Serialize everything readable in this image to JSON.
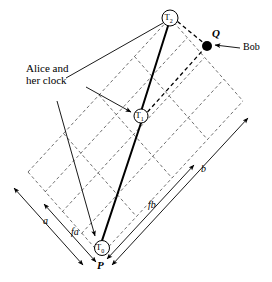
{
  "figure": {
    "type": "spacetime-diagram",
    "background_color": "#ffffff",
    "stroke_color": "#000000",
    "dash_color": "#555555",
    "nodes": [
      {
        "id": "T0",
        "label": "T",
        "sub": "0",
        "x": 102,
        "y": 248,
        "r": 7.5
      },
      {
        "id": "T1",
        "label": "T",
        "sub": "1",
        "x": 141,
        "y": 116,
        "r": 7.0
      },
      {
        "id": "T2",
        "label": "T",
        "sub": "2",
        "x": 170,
        "y": 18,
        "r": 8.0
      }
    ],
    "points": [
      {
        "id": "P",
        "label": "P",
        "x": 102,
        "y": 248,
        "label_x": 97,
        "label_y": 261
      },
      {
        "id": "Q",
        "label": "Q",
        "x": 207,
        "y": 46,
        "label_x": 212,
        "label_y": 29,
        "dot_r": 5
      }
    ],
    "annotations": [
      {
        "id": "alice",
        "line1": "Alice and",
        "line2": "her clock",
        "x": 26,
        "y": 63
      },
      {
        "id": "bob",
        "text": "Bob",
        "x": 243,
        "y": 43
      }
    ],
    "vectors": [
      {
        "id": "a",
        "label": "a",
        "label_x": 43,
        "label_y": 216
      },
      {
        "id": "fa",
        "label": "fa",
        "label_x": 71,
        "label_y": 227
      },
      {
        "id": "fb",
        "label": "fb",
        "label_x": 148,
        "label_y": 200
      },
      {
        "id": "b",
        "label": "b",
        "label_x": 201,
        "label_y": 164
      }
    ]
  }
}
